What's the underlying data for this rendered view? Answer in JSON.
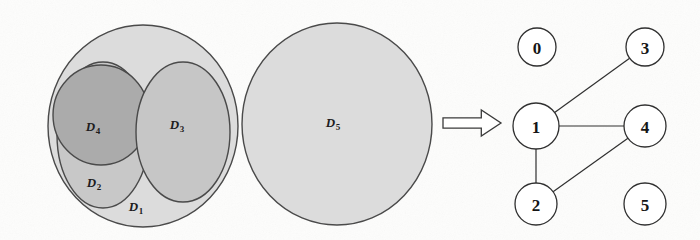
{
  "figure": {
    "type": "diagram",
    "background_color": "#fdfdfc",
    "ink_color": "#303030"
  },
  "left_panel": {
    "name": "region-diagram",
    "regions": [
      {
        "id": "D1",
        "label": "D",
        "subscript": "1",
        "shape": "ellipse",
        "cx": 143,
        "cy": 126,
        "rx": 95,
        "ry": 101,
        "fill": "#dcdcdc",
        "label_x": 136,
        "label_y": 208
      },
      {
        "id": "D2",
        "label": "D",
        "subscript": "2",
        "shape": "ellipse",
        "cx": 103,
        "cy": 135,
        "rx": 46,
        "ry": 73,
        "fill": "#c8c8c8",
        "label_x": 94,
        "label_y": 184
      },
      {
        "id": "D4",
        "label": "D",
        "subscript": "4",
        "shape": "ellipse",
        "cx": 101,
        "cy": 115,
        "rx": 48,
        "ry": 50,
        "fill": "#ababab",
        "label_x": 93,
        "label_y": 128
      },
      {
        "id": "D3",
        "label": "D",
        "subscript": "3",
        "shape": "ellipse",
        "cx": 183,
        "cy": 132,
        "rx": 47,
        "ry": 70,
        "fill": "#c6c6c6",
        "label_x": 177,
        "label_y": 126
      },
      {
        "id": "D5",
        "label": "D",
        "subscript": "5",
        "shape": "circle",
        "cx": 337,
        "cy": 124,
        "rx": 95,
        "ry": 101,
        "fill": "#dcdcdc",
        "label_x": 333,
        "label_y": 124
      }
    ]
  },
  "arrow": {
    "name": "implies-arrow",
    "glyph": "double-right-arrow",
    "x": 443,
    "y": 123,
    "width": 58,
    "height": 26
  },
  "right_panel": {
    "name": "inclusion-graph",
    "nodes": [
      {
        "id": "0",
        "label": "0",
        "cx": 537,
        "cy": 47,
        "r": 19
      },
      {
        "id": "3",
        "label": "3",
        "cx": 645,
        "cy": 47,
        "r": 19
      },
      {
        "id": "1",
        "label": "1",
        "cx": 536,
        "cy": 126,
        "r": 23
      },
      {
        "id": "4",
        "label": "4",
        "cx": 645,
        "cy": 126,
        "r": 21
      },
      {
        "id": "2",
        "label": "2",
        "cx": 536,
        "cy": 204,
        "r": 21
      },
      {
        "id": "5",
        "label": "5",
        "cx": 645,
        "cy": 204,
        "r": 21
      }
    ],
    "edges": [
      {
        "from": "1",
        "to": "3"
      },
      {
        "from": "1",
        "to": "4"
      },
      {
        "from": "1",
        "to": "2"
      },
      {
        "from": "2",
        "to": "4"
      }
    ]
  }
}
